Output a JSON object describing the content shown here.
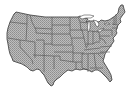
{
  "map": {
    "title": "Contiguous United States",
    "type": "state-outline-map",
    "fill_color": "#b4b4b4",
    "stipple_color": "#8c8c8c",
    "border_color": "#4a4a4a",
    "background_color": "#ffffff",
    "regions": [
      "Washington",
      "Oregon",
      "California",
      "Idaho",
      "Nevada",
      "Montana",
      "Wyoming",
      "Utah",
      "Arizona",
      "Colorado",
      "New Mexico",
      "North Dakota",
      "South Dakota",
      "Nebraska",
      "Kansas",
      "Oklahoma",
      "Texas",
      "Minnesota",
      "Iowa",
      "Missouri",
      "Arkansas",
      "Louisiana",
      "Wisconsin",
      "Illinois",
      "Michigan",
      "Indiana",
      "Ohio",
      "Kentucky",
      "Tennessee",
      "Mississippi",
      "Alabama",
      "Georgia",
      "Florida",
      "South Carolina",
      "North Carolina",
      "Virginia",
      "West Virginia",
      "Pennsylvania",
      "New York",
      "Maryland",
      "Delaware",
      "New Jersey",
      "Connecticut",
      "Rhode Island",
      "Massachusetts",
      "Vermont",
      "New Hampshire",
      "Maine"
    ],
    "water_features": [
      "Lake Superior",
      "Lake Michigan",
      "Lake Huron",
      "Lake Erie",
      "Lake Ontario"
    ]
  }
}
